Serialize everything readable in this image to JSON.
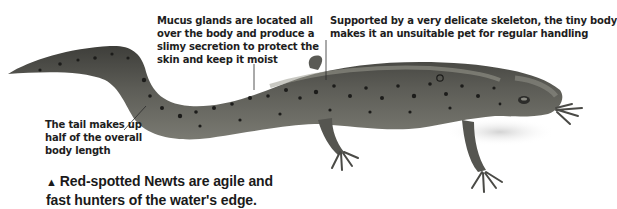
{
  "annotations": {
    "mucus": {
      "lines": [
        "Mucus glands are located all",
        "over the body and produce a",
        "slimy secretion to protect the",
        "skin and keep it moist"
      ]
    },
    "skeleton": {
      "lines": [
        "Supported by a very delicate skeleton, the tiny body",
        "makes it an unsuitable pet for regular handling"
      ]
    },
    "tail": {
      "lines": [
        "The tail makes up",
        "half of the overall",
        "body length"
      ]
    }
  },
  "caption": {
    "marker": "▲",
    "lines": [
      "Red-spotted Newts are agile and",
      "fast hunters of the water's edge."
    ]
  },
  "image": {
    "subject": "red-spotted newt",
    "colors": {
      "body": "#5a5a55",
      "belly": "#8a8a82",
      "spots": "#1c1c1a",
      "text": "#1e1e1e",
      "background": "#ffffff"
    }
  }
}
